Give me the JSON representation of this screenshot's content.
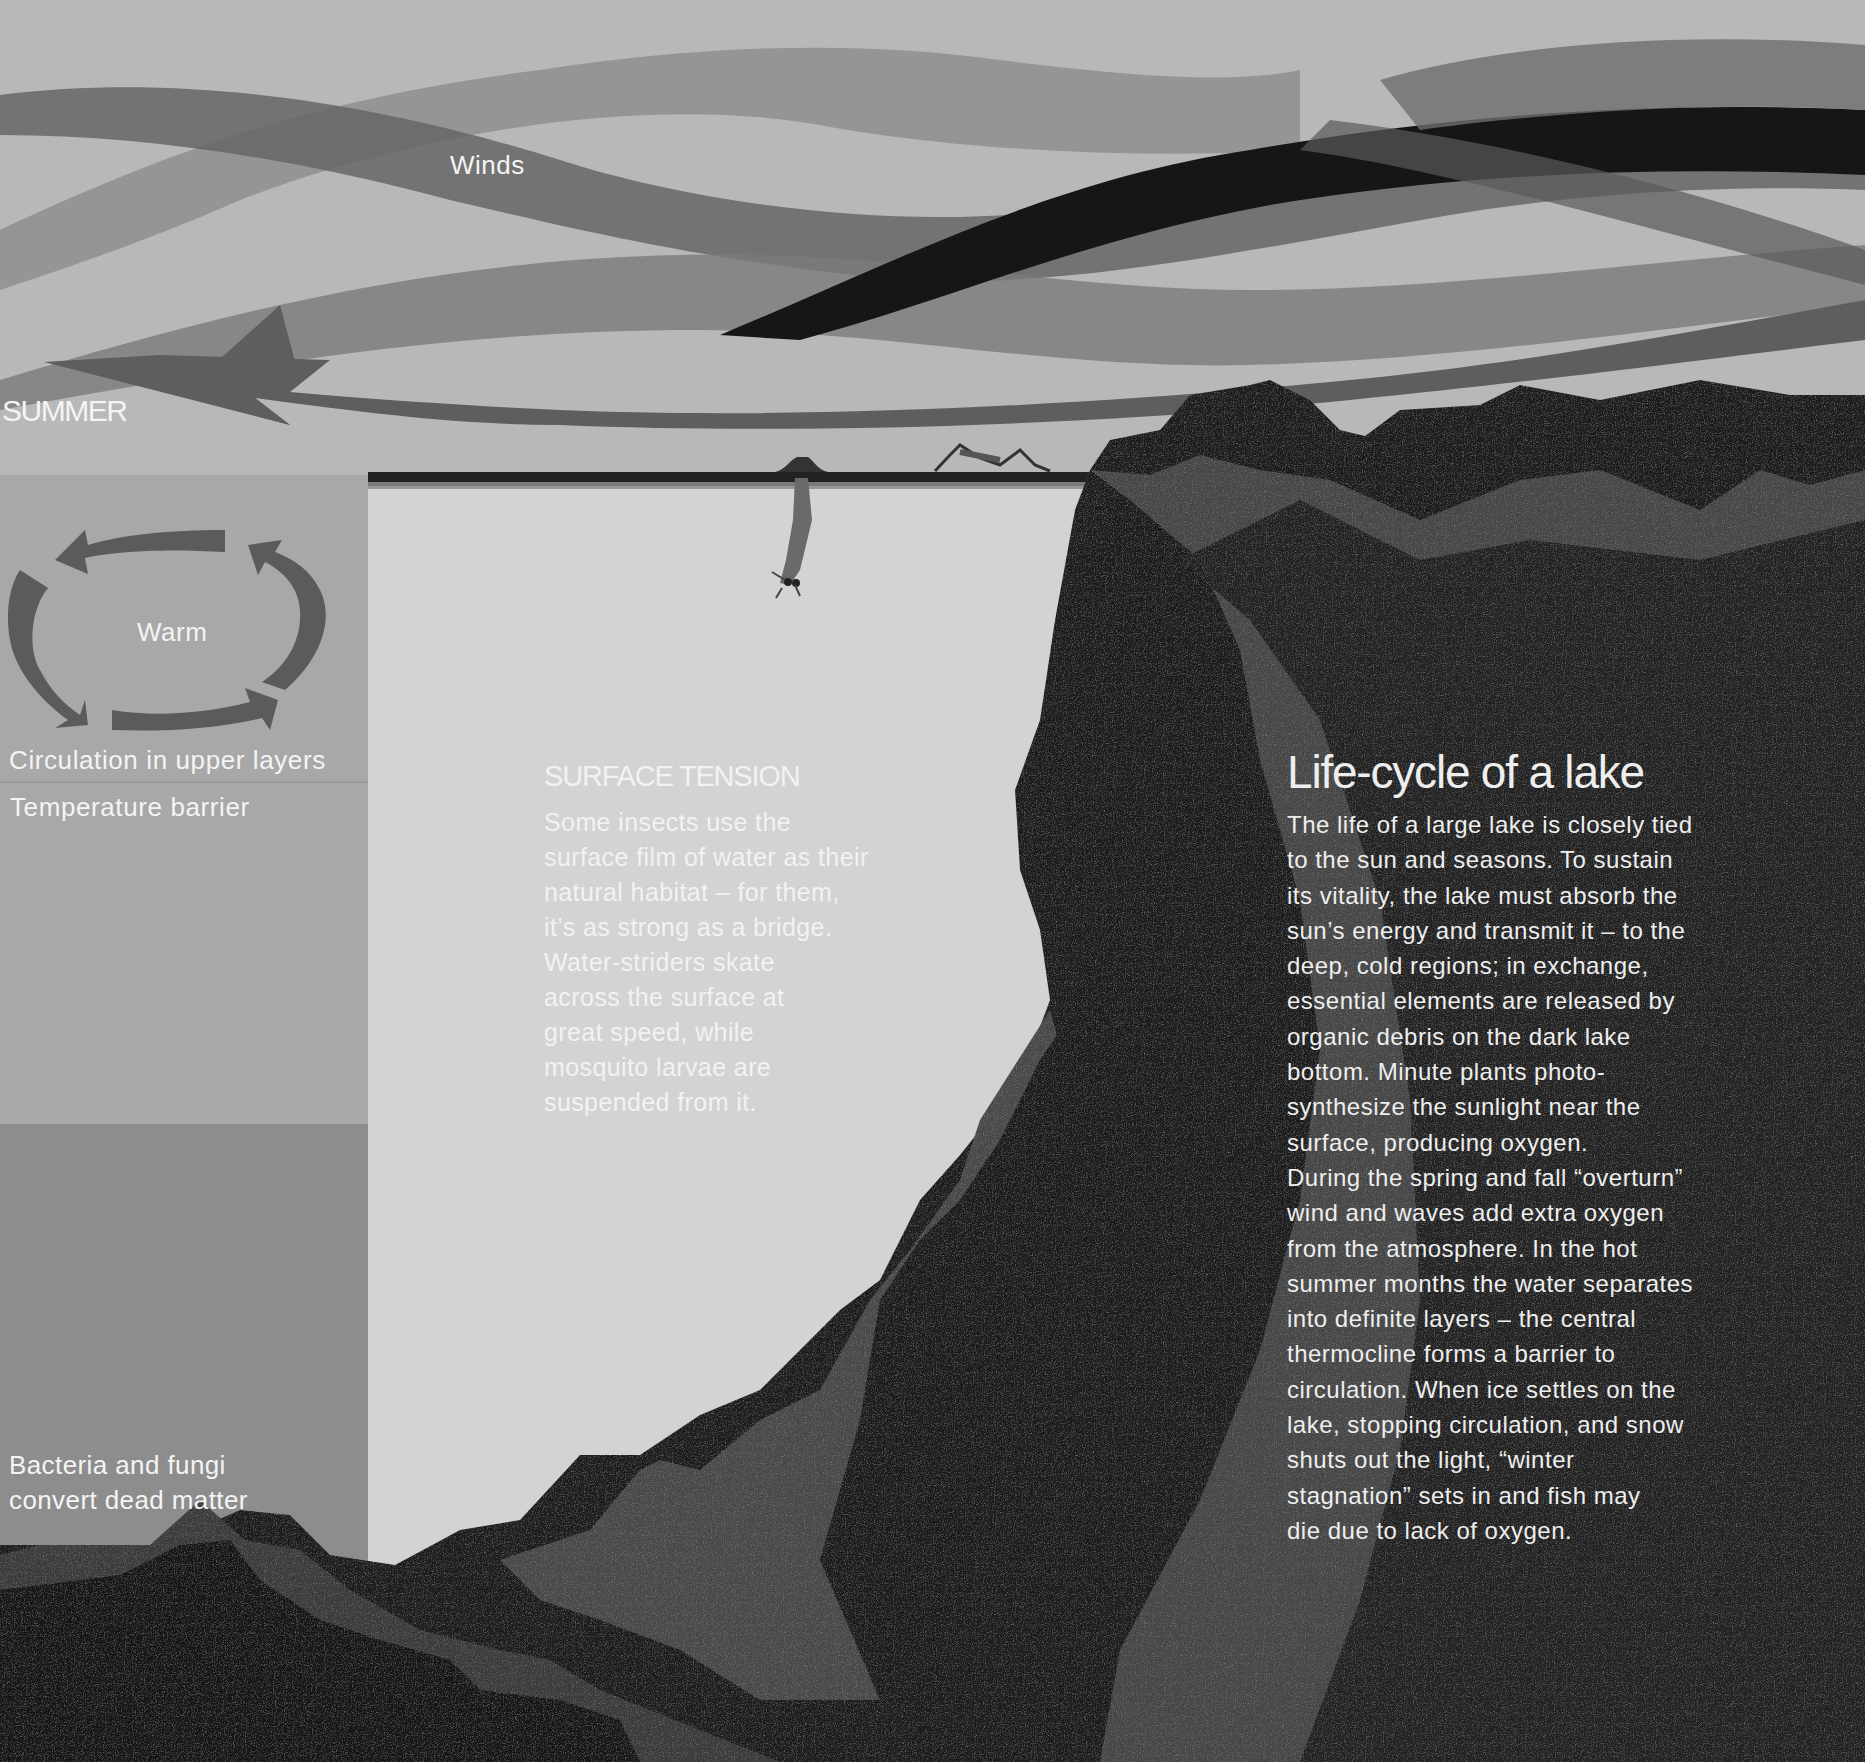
{
  "labels": {
    "winds": "Winds",
    "season": "SUMMER",
    "warm": "Warm",
    "circulation": "Circulation in upper layers",
    "temperature_barrier": "Temperature barrier",
    "bacteria_lines": [
      "Bacteria and fungi",
      "convert dead matter"
    ]
  },
  "surface_tension": {
    "title": "SURFACE TENSION",
    "lines": [
      "Some insects use the",
      "surface film of water as their",
      "natural habitat – for them,",
      "it’s as strong as a bridge.",
      "Water-striders skate",
      "across the surface at",
      "great speed, while",
      "mosquito larvae are",
      "suspended from it."
    ]
  },
  "life_cycle": {
    "title": "Life-cycle of a lake",
    "lines": [
      "The life of a large lake is closely tied",
      "to the sun and seasons. To sustain",
      "its vitality, the lake must absorb the",
      "sun’s energy and transmit it – to the",
      "deep, cold regions; in exchange,",
      "essential elements are released by",
      "organic debris on the dark lake",
      "bottom. Minute plants photo-",
      "synthesize the sunlight near the",
      "surface, producing oxygen.",
      "During the spring and fall “overturn”",
      "wind and waves add extra oxygen",
      "from the atmosphere. In the hot",
      "summer months the water separates",
      "into definite layers – the central",
      "thermocline forms a barrier to",
      "circulation. When ice settles on the",
      "lake, stopping circulation, and snow",
      "shuts out the light, “winter",
      "stagnation” sets in and fish may",
      "die due to lack of oxygen."
    ]
  },
  "icons": {
    "wind_arrow": "left-arrow-icon",
    "circulation_arrows": "circular-arrows-icon",
    "mosquito_larva": "mosquito-larva-icon",
    "water_strider": "water-strider-icon"
  },
  "colors": {
    "sky": "#b9b9b9",
    "upper_water_panel": "#a9a9a9",
    "lower_water_panel": "#8d8d8d",
    "lake_water": "#d2d2d2",
    "rock_dark": "#1d1d1d",
    "rock_mid": "#474747",
    "text": "#f2f2f2"
  }
}
